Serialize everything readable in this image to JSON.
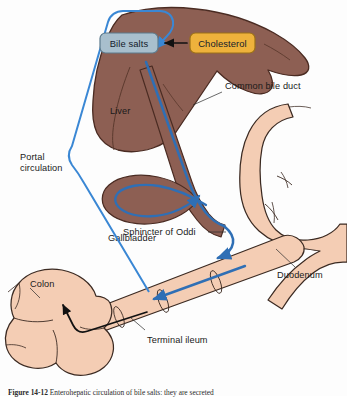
{
  "figure": {
    "title": "Enterohepatic circulation of bile salts",
    "caption_label": "Figure 14-12",
    "caption_text": "Enterohepatic circulation of bile salts: they are secreted",
    "background_color": "#fdfdfd"
  },
  "boxes": [
    {
      "id": "bile-salts",
      "label": "Bile salts",
      "fill": "#a8bfcd",
      "stroke": "#5c7a8c",
      "text_color": "#14202b"
    },
    {
      "id": "cholesterol",
      "label": "Cholesterol",
      "fill": "#eeb23c",
      "stroke": "#9c7118",
      "text_color": "#14202b"
    }
  ],
  "organs": [
    {
      "id": "liver",
      "label": "Liver",
      "fill": "#8d5f53",
      "stroke": "#4a2b22"
    },
    {
      "id": "gallbladder",
      "label": "Gallbladder",
      "fill": "#8d5f53",
      "stroke": "#4a2b22"
    },
    {
      "id": "duodenum",
      "label": "Duodenum",
      "fill": "#f4cdb4",
      "stroke": "#3b2a22"
    },
    {
      "id": "colon",
      "label": "Colon",
      "fill": "#f4cdb4",
      "stroke": "#3b2a22"
    },
    {
      "id": "terminal-ileum",
      "label": "Terminal ileum",
      "fill": "#f4cdb4",
      "stroke": "#3b2a22"
    }
  ],
  "structures": [
    {
      "id": "common-bile-duct",
      "label": "Common bile duct",
      "fill": "#8d5f53",
      "stroke": "#4a2b22"
    },
    {
      "id": "sphincter-of-oddi",
      "label": "Sphincter of Oddi"
    }
  ],
  "pathways": [
    {
      "id": "portal-circulation",
      "label": "Portal circulation",
      "label_line_1": "Portal",
      "label_line_2": "circulation",
      "color": "#3a87d4"
    },
    {
      "id": "bile-flow",
      "label": "Bile flow",
      "color": "#2f6fb5"
    },
    {
      "id": "reabsorption-arrow",
      "label": "Reabsorption",
      "color": "#2f6fb5"
    },
    {
      "id": "cholesterol-conversion-arrow",
      "label": "Cholesterol to bile salts",
      "color": "#111111"
    },
    {
      "id": "colon-loss-arrow",
      "label": "Loss to colon",
      "color": "#111111"
    }
  ],
  "colors": {
    "liver_brown": "#8d5f53",
    "liver_outline": "#4a2b22",
    "gut_peach": "#f4cdb4",
    "gut_outline": "#3b2a22",
    "portal_blue": "#3a87d4",
    "bile_blue": "#2f6fb5",
    "bile_salts_box": "#a8bfcd",
    "cholesterol_box": "#eeb23c",
    "label_text": "#1a1a1a"
  }
}
